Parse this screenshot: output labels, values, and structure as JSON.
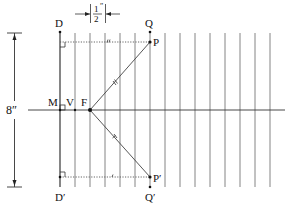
{
  "diagram": {
    "colors": {
      "line": "#555555",
      "dark": "#111111",
      "dotted": "#666666",
      "background": "#ffffff"
    },
    "labels": {
      "D": "D",
      "D_prime": "D′",
      "Q": "Q",
      "Q_prime": "Q′",
      "P": "P",
      "P_prime": "P′",
      "M": "M",
      "V": "V",
      "F": "F",
      "height_dim": "8″",
      "spacing_num": "1",
      "spacing_den": "2",
      "spacing_unit": "″"
    },
    "dimensions": {
      "height": "8 inches",
      "line_spacing": "1/2 inch"
    },
    "geometry": {
      "directrix_x": 60,
      "axis_y": 110,
      "line_top_y": 33,
      "line_bottom_y": 187,
      "vertical_lines_x": [
        60,
        75,
        90,
        105,
        120,
        135,
        150,
        165,
        180,
        195,
        210,
        225,
        240,
        255,
        270
      ],
      "points": {
        "M": [
          60,
          110
        ],
        "V": [
          75,
          110
        ],
        "F": [
          90,
          110
        ],
        "P": [
          150,
          42
        ],
        "P_prime": [
          150,
          177
        ],
        "Q": [
          150,
          32
        ],
        "Q_prime": [
          150,
          187
        ],
        "D": [
          60,
          32
        ],
        "D_prime": [
          60,
          187
        ]
      }
    }
  }
}
